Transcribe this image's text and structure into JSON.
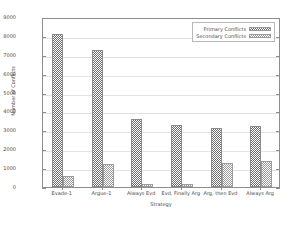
{
  "chart_data": {
    "type": "bar",
    "title": "",
    "xlabel": "Strategy",
    "ylabel": "Number of Conflicts",
    "categories": [
      "Evade-1",
      "Argue-1",
      "Always Evd",
      "Evd, Finally Arg",
      "Arg, then Evd",
      "Always Arg"
    ],
    "series": [
      {
        "name": "Primary Conflicts",
        "values": [
          8080,
          7250,
          3600,
          3300,
          3150,
          3250
        ]
      },
      {
        "name": "Secondary Conflicts",
        "values": [
          600,
          1200,
          170,
          150,
          1250,
          1400
        ]
      }
    ],
    "ylim": [
      0,
      9000
    ],
    "ytick_labels": [
      "0",
      "1000",
      "2000",
      "3000",
      "4000",
      "5000",
      "6000",
      "7000",
      "8000",
      "9000"
    ],
    "ytick_values": [
      0,
      1000,
      2000,
      3000,
      4000,
      5000,
      6000,
      7000,
      8000,
      9000
    ],
    "grid": true,
    "legend_position": "top-right",
    "colors": {
      "primary": "#6e6e6e",
      "secondary": "#9a9a9a",
      "axis": "#8d8d8d",
      "grid": "#e2e2e2",
      "text": "#4a4a4a"
    }
  },
  "legend": {
    "entries": [
      {
        "label": "Primary Conflicts"
      },
      {
        "label": "Secondary Conflicts"
      }
    ]
  }
}
